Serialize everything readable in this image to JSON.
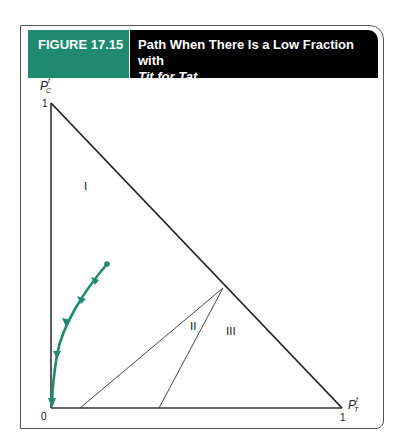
{
  "figure": {
    "number": "FIGURE 17.15",
    "title_line1": "Path When There Is a Low Fraction with",
    "title_line2": "Tit for Tat",
    "header_colors": {
      "number_bg": "#1f8a6e",
      "title_bg": "#000000"
    }
  },
  "axes": {
    "y_label": "P",
    "y_sup": "t",
    "y_sub": "C",
    "x_label": "P",
    "x_sup": "t",
    "x_sub": "T",
    "origin": "0",
    "y_max": "1",
    "x_max": "1"
  },
  "regions": {
    "r1": "I",
    "r2": "II",
    "r3": "III"
  },
  "path": {
    "color": "#1f8a6e",
    "direction": "toward origin"
  }
}
